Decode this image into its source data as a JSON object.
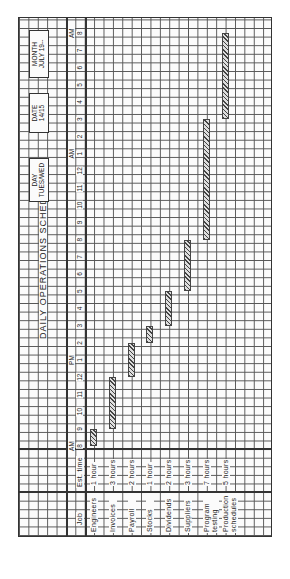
{
  "form": {
    "title": "DAILY OPERATIONS SCHEDULE",
    "day_label": "DAY",
    "day_value": "TUES/WED",
    "date_label": "DATE",
    "date_value": "14/15",
    "month_label": "MONTH",
    "month_value": "JULY 19--",
    "col_job": "Job",
    "col_est_time": "Est. time"
  },
  "chart_data": {
    "type": "gantt",
    "title": "DAILY OPERATIONS SCHEDULE",
    "time_axis": {
      "ticks": [
        "8",
        "9",
        "10",
        "11",
        "12",
        "1",
        "2",
        "3",
        "4",
        "5",
        "6",
        "7",
        "8",
        "9",
        "10",
        "11",
        "12",
        "1",
        "2",
        "3",
        "4",
        "5",
        "6",
        "7",
        "8"
      ],
      "period_markers": [
        {
          "label": "AM",
          "at_index": 0
        },
        {
          "label": "PM",
          "at_index": 5
        },
        {
          "label": "AM",
          "at_index": 17
        },
        {
          "label": "AM",
          "at_index": 24
        }
      ],
      "start": "8 AM",
      "end": "8 AM (next day)",
      "unit": "hour"
    },
    "tasks": [
      {
        "job": "Engineers",
        "est_time": "1 hour",
        "start": 0,
        "end": 1,
        "start_label": "8 AM",
        "end_label": "9 AM"
      },
      {
        "job": "Invoices",
        "est_time": "3 hours",
        "start": 1,
        "end": 4,
        "start_label": "9 AM",
        "end_label": "12 PM"
      },
      {
        "job": "Payroll",
        "est_time": "2 hours",
        "start": 4,
        "end": 6,
        "start_label": "12 PM",
        "end_label": "2 PM"
      },
      {
        "job": "Stocks",
        "est_time": "1 hour",
        "start": 6,
        "end": 7,
        "start_label": "2 PM",
        "end_label": "3 PM"
      },
      {
        "job": "Dividends",
        "est_time": "2 hours",
        "start": 7,
        "end": 9,
        "start_label": "3 PM",
        "end_label": "5 PM"
      },
      {
        "job": "Suppliers",
        "est_time": "3 hours",
        "start": 9,
        "end": 12,
        "start_label": "5 PM",
        "end_label": "8 PM"
      },
      {
        "job": "Program testing",
        "est_time": "7 hours",
        "start": 12,
        "end": 19,
        "start_label": "8 PM",
        "end_label": "3 AM"
      },
      {
        "job": "Production schedules",
        "est_time": "5 hours",
        "start": 19,
        "end": 24,
        "start_label": "3 AM",
        "end_label": "8 AM"
      }
    ],
    "rotation": "page rotated 90 degrees counter-clockwise"
  }
}
